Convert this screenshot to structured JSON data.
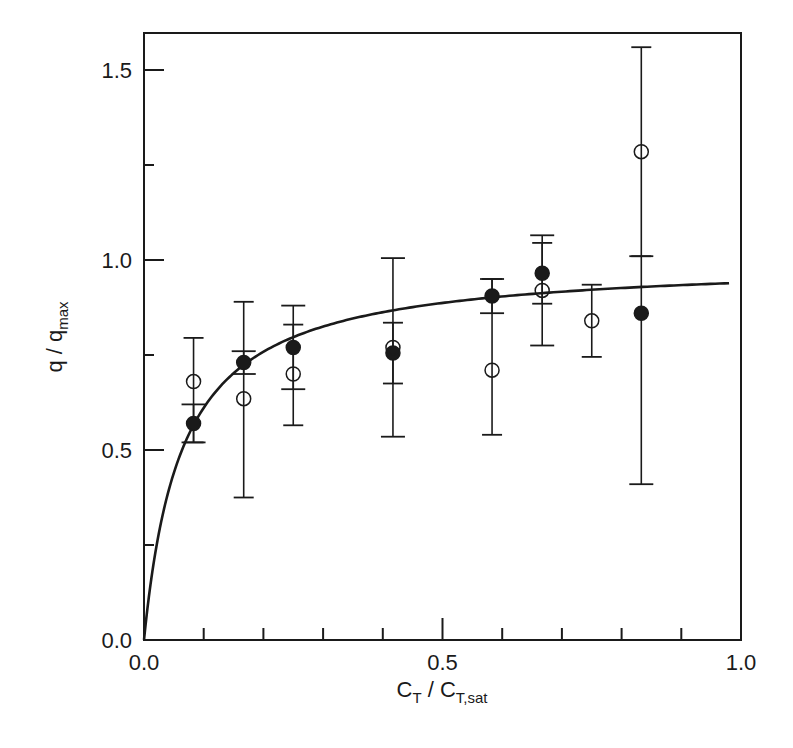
{
  "chart_data": {
    "type": "scatter",
    "title": "",
    "xlabel": "C_T / C_T,sat",
    "xlabel_parts": {
      "main1": "C",
      "sub1": "T",
      "sep": " / C",
      "sub2": "T,sat"
    },
    "ylabel": "q / q_max",
    "ylabel_parts": {
      "main": "q / q",
      "sub": "max"
    },
    "xlim": [
      0.0,
      1.0
    ],
    "ylim": [
      0.0,
      1.6
    ],
    "x_ticks_major": [
      0.0,
      0.5,
      1.0
    ],
    "x_tick_labels": [
      "0.0",
      "0.5",
      "1.0"
    ],
    "x_ticks_minor_step": 0.1,
    "y_ticks_major": [
      0.0,
      0.5,
      1.0,
      1.5
    ],
    "y_tick_labels": [
      "0.0",
      "0.5",
      "1.0",
      "1.5"
    ],
    "y_ticks_minor_step": 0.25,
    "grid": false,
    "legend": null,
    "series": [
      {
        "name": "filled",
        "marker": "filled-circle",
        "x": [
          0.083,
          0.167,
          0.25,
          0.417,
          0.583,
          0.667,
          0.833
        ],
        "y": [
          0.57,
          0.73,
          0.77,
          0.755,
          0.905,
          0.965,
          0.86
        ],
        "err_low": [
          0.52,
          0.7,
          0.66,
          0.535,
          0.86,
          0.775,
          0.41
        ],
        "err_high": [
          0.62,
          0.76,
          0.88,
          1.005,
          0.95,
          1.065,
          1.01
        ]
      },
      {
        "name": "open",
        "marker": "open-circle",
        "x": [
          0.083,
          0.167,
          0.25,
          0.417,
          0.583,
          0.667,
          0.75,
          0.833
        ],
        "y": [
          0.68,
          0.635,
          0.7,
          0.77,
          0.71,
          0.92,
          0.84,
          1.285
        ],
        "err_low": [
          0.52,
          0.375,
          0.565,
          0.675,
          0.54,
          0.885,
          0.745,
          1.01
        ],
        "err_high": [
          0.795,
          0.89,
          0.83,
          0.835,
          0.95,
          1.045,
          0.935,
          1.56
        ]
      },
      {
        "name": "fit",
        "type": "line",
        "model": "y = K x / (1 + K x)",
        "K": 15.7,
        "x_range": [
          0.0,
          0.98
        ]
      }
    ]
  },
  "colors": {
    "ink": "#1a1a1a",
    "background": "#ffffff"
  }
}
